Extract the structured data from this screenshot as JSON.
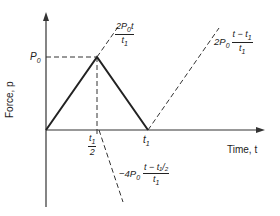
{
  "diagram": {
    "type": "force-time pulse diagram",
    "y_axis_label": "Force, p",
    "x_axis_label": "Time, t",
    "peak_label": "P0",
    "x_ticks": [
      "t1/2",
      "t1"
    ],
    "segments": [
      {
        "name": "rise",
        "expression": "2P0 t / t1"
      },
      {
        "name": "fall",
        "expression": "-4P0 (t - t1/2) / t1"
      },
      {
        "name": "rebound",
        "expression": "2P0 (t - t1) / t1"
      }
    ]
  },
  "labels": {
    "y_axis": "Force, p",
    "x_axis": "Time, t",
    "p0_main": "P",
    "p0_sub": "0",
    "t1_main": "t",
    "t1_sub": "1",
    "half_den": "2",
    "rise_num_coef": "2P",
    "rise_num_sub": "0",
    "rise_num_var": "t",
    "rise_den": "t",
    "rise_den_sub": "1",
    "rebound_coef": "2P",
    "rebound_coef_sub": "0",
    "rebound_num": "t − t",
    "rebound_num_sub": "1",
    "rebound_den": "t",
    "rebound_den_sub": "1",
    "fall_coef": "−4P",
    "fall_coef_sub": "0",
    "fall_num": "t − ",
    "fall_num_tail": "t₁/₂",
    "fall_den": "t",
    "fall_den_sub": "1"
  }
}
